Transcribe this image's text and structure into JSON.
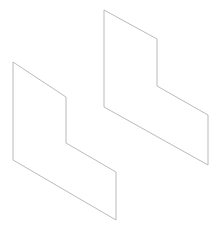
{
  "canvas": {
    "width": 222,
    "height": 230,
    "background_color": "#ffffff"
  },
  "drawing": {
    "title": "two-offset-step-polygons",
    "stroke_color": "#b2b2b2",
    "stroke_width": 0.9,
    "fill": "none",
    "shapes": [
      {
        "name": "left-step-polygon",
        "points": "13,62 66,97 66,143 116,172 116,220 13,160",
        "vertices": [
          [
            13,
            62
          ],
          [
            66,
            97
          ],
          [
            66,
            143
          ],
          [
            116,
            172
          ],
          [
            116,
            220
          ],
          [
            13,
            160
          ]
        ]
      },
      {
        "name": "right-step-polygon",
        "points": "104,10 157,39 157,86 208,115 208,165 104,107",
        "vertices": [
          [
            104,
            10
          ],
          [
            157,
            39
          ],
          [
            157,
            86
          ],
          [
            208,
            115
          ],
          [
            208,
            165
          ],
          [
            104,
            107
          ]
        ]
      }
    ]
  }
}
